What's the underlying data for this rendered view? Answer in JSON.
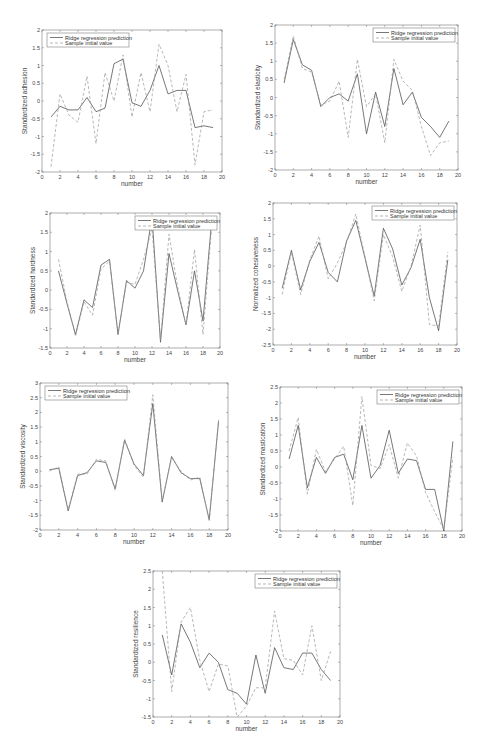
{
  "header": {
    "page_text": ""
  },
  "legend": {
    "pred": "Ridge regression prediction",
    "sample": "Sample initial value"
  },
  "colors": {
    "pred": "#555555",
    "sample": "#9a9a9a",
    "axis": "#777777"
  },
  "chart_data": [
    {
      "type": "line",
      "id": "adhesion",
      "title": "",
      "xlabel": "number",
      "ylabel": "Standardized adhesion",
      "xlim": [
        0,
        20
      ],
      "ylim": [
        -2,
        2
      ],
      "xticks": [
        0,
        2,
        4,
        6,
        8,
        10,
        12,
        14,
        16,
        18,
        20
      ],
      "yticks": [
        -2,
        -1.5,
        -1,
        -0.5,
        0,
        0.5,
        1,
        1.5,
        2
      ],
      "legend_position": "top-left",
      "x": [
        1,
        2,
        3,
        4,
        5,
        6,
        7,
        8,
        9,
        10,
        11,
        12,
        13,
        14,
        15,
        16,
        17,
        18,
        19
      ],
      "series": [
        {
          "name": "Ridge regression prediction",
          "style": "solid",
          "values": [
            -0.45,
            -0.15,
            -0.25,
            -0.25,
            0.1,
            -0.3,
            -0.2,
            1.05,
            1.18,
            -0.05,
            -0.15,
            0.3,
            1.0,
            0.2,
            0.3,
            0.3,
            -0.75,
            -0.7,
            -0.75
          ]
        },
        {
          "name": "Sample initial value",
          "style": "dashed",
          "values": [
            -1.85,
            0.2,
            -0.4,
            -0.6,
            0.7,
            -1.2,
            0.8,
            0.0,
            1.3,
            -0.45,
            0.8,
            -0.3,
            1.6,
            1.0,
            -0.3,
            0.75,
            -1.8,
            -0.3,
            -0.25
          ]
        }
      ]
    },
    {
      "type": "line",
      "id": "elasticity",
      "title": "",
      "xlabel": "number",
      "ylabel": "Standardized elasticity",
      "xlim": [
        0,
        20
      ],
      "ylim": [
        -2,
        2
      ],
      "xticks": [
        0,
        2,
        4,
        6,
        8,
        10,
        12,
        14,
        16,
        18,
        20
      ],
      "yticks": [
        -2,
        -1.5,
        -1,
        -0.5,
        0,
        0.5,
        1,
        1.5,
        2
      ],
      "legend_position": "top-right",
      "x": [
        1,
        2,
        3,
        4,
        5,
        6,
        7,
        8,
        9,
        10,
        11,
        12,
        13,
        14,
        15,
        16,
        17,
        18,
        19
      ],
      "series": [
        {
          "name": "Ridge regression prediction",
          "style": "solid",
          "values": [
            0.4,
            1.6,
            0.9,
            0.75,
            -0.25,
            0.0,
            0.1,
            -0.1,
            0.65,
            -1.0,
            0.15,
            -0.8,
            0.8,
            -0.2,
            0.15,
            -0.55,
            -0.8,
            -1.1,
            -0.65
          ]
        },
        {
          "name": "Sample initial value",
          "style": "dashed",
          "values": [
            0.5,
            1.7,
            0.8,
            0.7,
            -0.2,
            -0.1,
            0.45,
            -1.1,
            1.05,
            -0.25,
            0.1,
            -1.25,
            1.05,
            0.45,
            0.2,
            -0.8,
            -1.6,
            -1.25,
            -1.2
          ]
        }
      ]
    },
    {
      "type": "line",
      "id": "hardness",
      "title": "",
      "xlabel": "number",
      "ylabel": "Standardized hardness",
      "xlim": [
        0,
        20
      ],
      "ylim": [
        -1.5,
        2
      ],
      "xticks": [
        0,
        2,
        4,
        6,
        8,
        10,
        12,
        14,
        16,
        18,
        20
      ],
      "yticks": [
        -1.5,
        -1,
        -0.5,
        0,
        0.5,
        1,
        1.5,
        2
      ],
      "legend_position": "top-right",
      "x": [
        1,
        2,
        3,
        4,
        5,
        6,
        7,
        8,
        9,
        10,
        11,
        12,
        13,
        14,
        15,
        16,
        17,
        18,
        19
      ],
      "series": [
        {
          "name": "Ridge regression prediction",
          "style": "solid",
          "values": [
            0.5,
            -0.35,
            -1.15,
            -0.25,
            -0.45,
            0.65,
            0.8,
            -1.15,
            0.25,
            0.05,
            0.5,
            1.9,
            -1.35,
            0.95,
            0.0,
            -0.9,
            0.5,
            -0.8,
            1.75
          ]
        },
        {
          "name": "Sample initial value",
          "style": "dashed",
          "values": [
            0.8,
            -0.3,
            -1.2,
            -0.3,
            -0.65,
            0.55,
            0.75,
            -1.15,
            0.2,
            0.15,
            0.8,
            1.6,
            -1.3,
            1.45,
            0.1,
            -0.9,
            1.05,
            -1.15,
            1.6
          ]
        }
      ]
    },
    {
      "type": "line",
      "id": "cohesiveness",
      "title": "",
      "xlabel": "number",
      "ylabel": "Normalized cohesiveness",
      "xlim": [
        0,
        20
      ],
      "ylim": [
        -2.5,
        2
      ],
      "xticks": [
        0,
        2,
        4,
        6,
        8,
        10,
        12,
        14,
        16,
        18,
        20
      ],
      "yticks": [
        -2.5,
        -2,
        -1.5,
        -1,
        -0.5,
        0,
        0.5,
        1,
        1.5,
        2
      ],
      "legend_position": "top-right",
      "x": [
        1,
        2,
        3,
        4,
        5,
        6,
        7,
        8,
        9,
        10,
        11,
        12,
        13,
        14,
        15,
        16,
        17,
        18,
        19
      ],
      "series": [
        {
          "name": "Ridge regression prediction",
          "style": "solid",
          "values": [
            -0.7,
            0.5,
            -0.75,
            0.15,
            0.75,
            -0.2,
            -0.5,
            0.8,
            1.45,
            0.25,
            -0.95,
            1.2,
            0.55,
            -0.6,
            -0.05,
            0.85,
            -1.0,
            -2.05,
            0.2
          ]
        },
        {
          "name": "Sample initial value",
          "style": "dashed",
          "values": [
            -0.9,
            0.45,
            -0.9,
            0.2,
            0.95,
            -0.4,
            0.1,
            0.75,
            1.65,
            0.3,
            -1.1,
            1.0,
            0.3,
            -0.8,
            0.0,
            1.3,
            -1.85,
            -1.9,
            0.45
          ]
        }
      ]
    },
    {
      "type": "line",
      "id": "viscosity",
      "title": "",
      "xlabel": "number",
      "ylabel": "Standardized viscosity",
      "xlim": [
        0,
        20
      ],
      "ylim": [
        -2,
        3
      ],
      "xticks": [
        0,
        2,
        4,
        6,
        8,
        10,
        12,
        14,
        16,
        18,
        20
      ],
      "yticks": [
        -2,
        -1.5,
        -1,
        -0.5,
        0,
        0.5,
        1,
        1.5,
        2,
        2.5,
        3
      ],
      "legend_position": "top-left",
      "x": [
        1,
        2,
        3,
        4,
        5,
        6,
        7,
        8,
        9,
        10,
        11,
        12,
        13,
        14,
        15,
        16,
        17,
        18,
        19
      ],
      "series": [
        {
          "name": "Ridge regression prediction",
          "style": "solid",
          "values": [
            0.05,
            0.1,
            -1.35,
            -0.15,
            -0.05,
            0.35,
            0.3,
            -0.6,
            1.05,
            0.25,
            -0.15,
            2.3,
            -1.05,
            0.5,
            -0.05,
            -0.25,
            -0.25,
            -1.65,
            1.7
          ]
        },
        {
          "name": "Sample initial value",
          "style": "dashed",
          "values": [
            0.0,
            0.15,
            -1.3,
            -0.1,
            -0.1,
            0.4,
            0.35,
            -0.65,
            1.1,
            0.2,
            -0.2,
            2.6,
            -1.0,
            0.45,
            0.0,
            -0.3,
            -0.2,
            -1.7,
            1.75
          ]
        }
      ]
    },
    {
      "type": "line",
      "id": "mastication",
      "title": "",
      "xlabel": "number",
      "ylabel": "Standardized mastication",
      "xlim": [
        0,
        20
      ],
      "ylim": [
        -2,
        2.5
      ],
      "xticks": [
        0,
        2,
        4,
        6,
        8,
        10,
        12,
        14,
        16,
        18,
        20
      ],
      "yticks": [
        -2,
        -1.5,
        -1,
        -0.5,
        0,
        0.5,
        1,
        1.5,
        2,
        2.5
      ],
      "legend_position": "top-right",
      "x": [
        1,
        2,
        3,
        4,
        5,
        6,
        7,
        8,
        9,
        10,
        11,
        12,
        13,
        14,
        15,
        16,
        17,
        18,
        19
      ],
      "series": [
        {
          "name": "Ridge regression prediction",
          "style": "solid",
          "values": [
            0.25,
            1.3,
            -0.65,
            0.3,
            -0.2,
            0.3,
            0.4,
            -0.4,
            1.3,
            -0.35,
            0.05,
            1.15,
            -0.2,
            0.25,
            0.2,
            -0.7,
            -0.7,
            -2.0,
            0.8
          ]
        },
        {
          "name": "Sample initial value",
          "style": "dashed",
          "values": [
            0.5,
            1.55,
            -0.85,
            0.55,
            -0.15,
            0.25,
            0.65,
            -1.2,
            2.2,
            0.05,
            -0.05,
            0.7,
            -0.35,
            0.75,
            0.35,
            -0.8,
            -1.4,
            -1.95,
            0.3
          ]
        }
      ]
    },
    {
      "type": "line",
      "id": "resilience",
      "title": "",
      "xlabel": "number",
      "ylabel": "Standardized resilience",
      "xlim": [
        0,
        20
      ],
      "ylim": [
        -1.5,
        2.5
      ],
      "xticks": [
        0,
        2,
        4,
        6,
        8,
        10,
        12,
        14,
        16,
        18,
        20
      ],
      "yticks": [
        -1.5,
        -1,
        -0.5,
        0,
        0.5,
        1,
        1.5,
        2,
        2.5
      ],
      "legend_position": "top-right",
      "x": [
        1,
        2,
        3,
        4,
        5,
        6,
        7,
        8,
        9,
        10,
        11,
        12,
        13,
        14,
        15,
        16,
        17,
        18,
        19
      ],
      "series": [
        {
          "name": "Ridge regression prediction",
          "style": "solid",
          "values": [
            0.75,
            -0.35,
            1.05,
            0.55,
            -0.15,
            0.25,
            0.0,
            -0.75,
            -0.85,
            -1.15,
            0.2,
            -0.85,
            0.4,
            -0.15,
            -0.2,
            0.25,
            0.25,
            -0.2,
            -0.5
          ]
        },
        {
          "name": "Sample initial value",
          "style": "dashed",
          "values": [
            2.5,
            -0.8,
            1.1,
            1.5,
            0.05,
            -0.8,
            -0.05,
            -0.1,
            -1.5,
            -1.2,
            -0.7,
            -0.7,
            1.4,
            0.1,
            0.05,
            -0.35,
            1.0,
            -0.5,
            0.3
          ]
        }
      ]
    }
  ],
  "caption": {
    "text": ""
  }
}
